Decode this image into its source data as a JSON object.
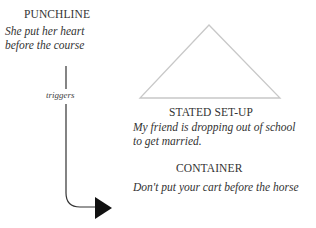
{
  "punchline": {
    "heading": "PUNCHLINE",
    "line1": "She put her heart",
    "line2": "before the course"
  },
  "connector": {
    "label": "triggers"
  },
  "stated_setup": {
    "heading": "STATED SET-UP",
    "line1": "My friend is dropping out of school",
    "line2": "to get married."
  },
  "container": {
    "heading": "CONTAINER",
    "line1": "Don't put your cart before the  horse"
  },
  "colors": {
    "triangle_stroke": "#c8c8c8",
    "arrow": "#111111",
    "text": "#333333"
  }
}
